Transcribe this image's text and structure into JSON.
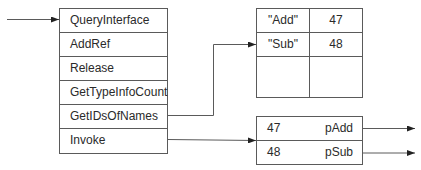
{
  "vtable": {
    "entries": [
      {
        "label": "QueryInterface"
      },
      {
        "label": "AddRef"
      },
      {
        "label": "Release"
      },
      {
        "label": "GetTypeInfoCount"
      },
      {
        "label": "GetIDsOfNames"
      },
      {
        "label": "Invoke"
      }
    ]
  },
  "name_table": {
    "rows": [
      {
        "name": "\"Add\"",
        "id": "47"
      },
      {
        "name": "\"Sub\"",
        "id": "48"
      },
      {
        "name": "",
        "id": ""
      }
    ]
  },
  "dispatch_table": {
    "rows": [
      {
        "id": "47",
        "pointer": "pAdd"
      },
      {
        "id": "48",
        "pointer": "pSub"
      }
    ]
  },
  "colors": {
    "line": "#5a5a5a",
    "text": "#2a2a2a",
    "background": "#ffffff"
  }
}
